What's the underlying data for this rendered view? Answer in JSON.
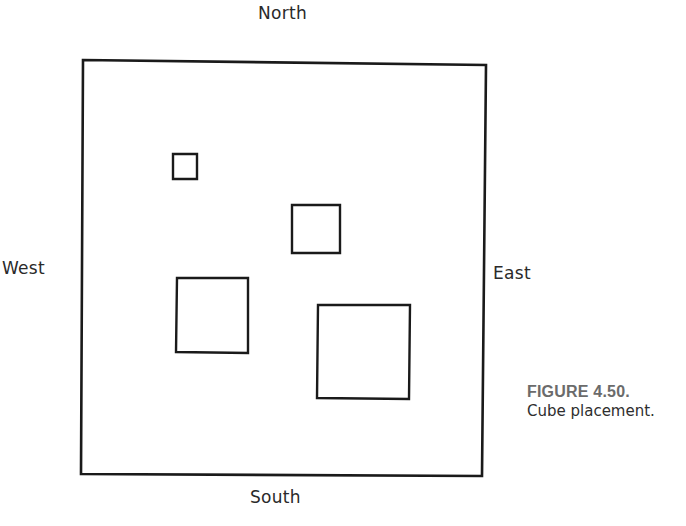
{
  "diagram": {
    "title": "Cube placement",
    "boundary": {
      "corners": [
        [
          83,
          60
        ],
        [
          486,
          65
        ],
        [
          482,
          476
        ],
        [
          81,
          474
        ]
      ],
      "stroke": "#1a1a1a"
    },
    "cubes": [
      {
        "id": "small",
        "corners": [
          [
            173,
            154
          ],
          [
            197,
            154
          ],
          [
            197,
            179
          ],
          [
            173,
            179
          ]
        ]
      },
      {
        "id": "medium",
        "corners": [
          [
            292,
            205
          ],
          [
            340,
            205
          ],
          [
            340,
            253
          ],
          [
            292,
            253
          ]
        ]
      },
      {
        "id": "large-left",
        "corners": [
          [
            177,
            278
          ],
          [
            248,
            278
          ],
          [
            248,
            353
          ],
          [
            176,
            352
          ]
        ]
      },
      {
        "id": "largest",
        "corners": [
          [
            318,
            305
          ],
          [
            410,
            305
          ],
          [
            409,
            399
          ],
          [
            317,
            398
          ]
        ]
      }
    ]
  },
  "labels": {
    "north": "North",
    "south": "South",
    "east": "East",
    "west": "West"
  },
  "caption": {
    "figure_number": "FIGURE 4.50.",
    "text": "Cube placement."
  }
}
